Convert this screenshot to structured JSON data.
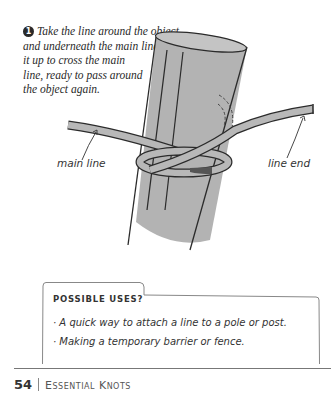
{
  "step": {
    "number": "1",
    "lines": [
      "Take the line around the object",
      "and underneath the main line. Bring",
      "it up to cross the main",
      "line, ready to pass around",
      "the object again."
    ]
  },
  "illustration": {
    "labels": {
      "main_line": "main line",
      "line_end": "line end"
    },
    "colors": {
      "pole": "#b3b3b3",
      "rope": "#b8b8b8",
      "outline": "#2b2b2b"
    }
  },
  "uses": {
    "title": "POSSIBLE USES?",
    "items": [
      "· A quick way to attach a line to a pole or post.",
      "· Making a temporary barrier or fence."
    ]
  },
  "footer": {
    "page_number": "54",
    "section": "Essential Knots"
  }
}
